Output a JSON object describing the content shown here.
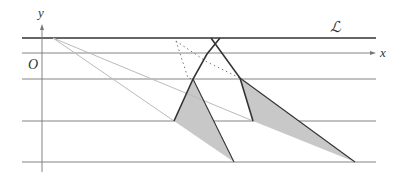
{
  "labels": {
    "y_axis": "y",
    "x_axis": "x",
    "origin": "O",
    "line_L": "ℒ"
  },
  "colors": {
    "thick_line": "#333333",
    "thin_line": "#777777",
    "ray": "#bbbbbb",
    "shade": "#c8c8c8",
    "dotted": "#777777"
  },
  "geometry": {
    "horizontal_lines_y": [
      38,
      53,
      79,
      121,
      162
    ],
    "y_axis_x": 42,
    "x_range": [
      22,
      376
    ]
  }
}
